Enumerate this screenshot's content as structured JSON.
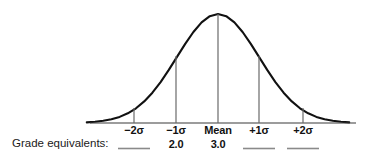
{
  "figure": {
    "caption_label": "Grade equivalents:",
    "axis": {
      "x_start": 90,
      "x_end": 356,
      "baseline_y": 123
    }
  },
  "chart_data": {
    "type": "line",
    "title": "",
    "subtitle": "",
    "xlabel": "",
    "ylabel": "",
    "grid": false,
    "legend": "none",
    "distribution": "normal",
    "mean": 0,
    "sd": 1,
    "xlim": [
      -3.2,
      3.2
    ],
    "ylim": [
      0,
      1
    ],
    "curve_description": "Symmetric bell-shaped normal distribution curve drawn over a horizontal baseline with vertical ordinate lines dropped at -2 SD, -1 SD, mean, +1 SD and +2 SD.",
    "markers": [
      {
        "id": "minus-2-sd",
        "tick_label": "−2σ",
        "x_value": -2,
        "x_px": 134,
        "ordinate_height_px": 15,
        "grade_equivalent": "",
        "grade_blank": true
      },
      {
        "id": "minus-1-sd",
        "tick_label": "−1σ",
        "x_value": -1,
        "x_px": 176,
        "ordinate_height_px": 67,
        "grade_equivalent": "2.0",
        "grade_blank": false
      },
      {
        "id": "mean",
        "tick_label": "Mean",
        "x_value": 0,
        "x_px": 218,
        "ordinate_height_px": 109,
        "grade_equivalent": "3.0",
        "grade_blank": false
      },
      {
        "id": "plus-1-sd",
        "tick_label": "+1σ",
        "x_value": 1,
        "x_px": 259,
        "ordinate_height_px": 67,
        "grade_equivalent": "",
        "grade_blank": true
      },
      {
        "id": "plus-2-sd",
        "tick_label": "+2σ",
        "x_value": 2,
        "x_px": 303,
        "ordinate_height_px": 15,
        "grade_equivalent": "",
        "grade_blank": true
      }
    ],
    "x": [
      -3.2,
      -3.0,
      -2.8,
      -2.6,
      -2.4,
      -2.2,
      -2.0,
      -1.8,
      -1.6,
      -1.4,
      -1.2,
      -1.0,
      -0.8,
      -0.6,
      -0.4,
      -0.2,
      0.0,
      0.2,
      0.4,
      0.6,
      0.8,
      1.0,
      1.2,
      1.4,
      1.6,
      1.8,
      2.0,
      2.2,
      2.4,
      2.6,
      2.8,
      3.0,
      3.2
    ],
    "y": [
      0.006,
      0.011,
      0.02,
      0.034,
      0.056,
      0.089,
      0.135,
      0.198,
      0.278,
      0.375,
      0.487,
      0.607,
      0.726,
      0.835,
      0.923,
      0.98,
      1.0,
      0.98,
      0.923,
      0.835,
      0.726,
      0.607,
      0.487,
      0.375,
      0.278,
      0.198,
      0.135,
      0.089,
      0.056,
      0.034,
      0.02,
      0.011,
      0.006
    ]
  },
  "colors": {
    "background": "#ffffff",
    "curve": "#111111",
    "axis": "#3a3a3a",
    "ordinate": "#6a6a6a",
    "blank_rule": "#8a8a8a",
    "text": "#111111"
  }
}
